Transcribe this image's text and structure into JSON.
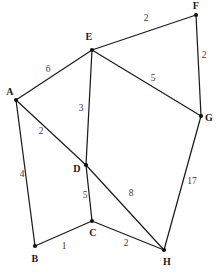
{
  "figure": {
    "width": 216,
    "height": 273,
    "background_color": "#ffffff",
    "edge_color": "#1c1c1c",
    "vertex_color": "#111111",
    "label_color": "#1a1a1a",
    "weight_color": "#3a3a3a"
  },
  "chart_data": {
    "type": "diagram",
    "title": "",
    "xlabel": "",
    "ylabel": "",
    "grid": false,
    "legend": "none",
    "nodes": [
      {
        "id": "A",
        "label": "A",
        "x": 16,
        "y": 100,
        "label_x": 10,
        "label_y": 92
      },
      {
        "id": "B",
        "label": "B",
        "x": 35,
        "y": 246,
        "label_x": 35,
        "label_y": 259
      },
      {
        "id": "C",
        "label": "C",
        "x": 92,
        "y": 221,
        "label_x": 93,
        "label_y": 233
      },
      {
        "id": "D",
        "label": "D",
        "x": 86,
        "y": 165,
        "label_x": 77,
        "label_y": 169
      },
      {
        "id": "E",
        "label": "E",
        "x": 92,
        "y": 50,
        "label_x": 89,
        "label_y": 37
      },
      {
        "id": "F",
        "label": "F",
        "x": 196,
        "y": 15,
        "label_x": 196,
        "label_y": 6
      },
      {
        "id": "G",
        "label": "G",
        "x": 201,
        "y": 116,
        "label_x": 209,
        "label_y": 118
      },
      {
        "id": "H",
        "label": "H",
        "x": 164,
        "y": 250,
        "label_x": 167,
        "label_y": 262
      }
    ],
    "edges": [
      {
        "from": "A",
        "to": "E",
        "weight": "6",
        "label_x": 48,
        "label_y": 70
      },
      {
        "from": "A",
        "to": "D",
        "weight": "2",
        "label_x": 41,
        "label_y": 132
      },
      {
        "from": "A",
        "to": "B",
        "weight": "4",
        "label_x": 22,
        "label_y": 175
      },
      {
        "from": "B",
        "to": "C",
        "weight": "1",
        "label_x": 64,
        "label_y": 247
      },
      {
        "from": "C",
        "to": "D",
        "weight": "5",
        "label_x": 85,
        "label_y": 196
      },
      {
        "from": "C",
        "to": "H",
        "weight": "2",
        "label_x": 126,
        "label_y": 244
      },
      {
        "from": "D",
        "to": "E",
        "weight": "3",
        "label_x": 81,
        "label_y": 109
      },
      {
        "from": "D",
        "to": "H",
        "weight": "8",
        "label_x": 131,
        "label_y": 194
      },
      {
        "from": "E",
        "to": "F",
        "weight": "2",
        "label_x": 146,
        "label_y": 19
      },
      {
        "from": "E",
        "to": "G",
        "weight": "5",
        "label_x": 153,
        "label_y": 79
      },
      {
        "from": "F",
        "to": "G",
        "weight": "2",
        "label_x": 204,
        "label_y": 56
      },
      {
        "from": "G",
        "to": "H",
        "weight": "17",
        "label_x": 192,
        "label_y": 182
      }
    ]
  }
}
